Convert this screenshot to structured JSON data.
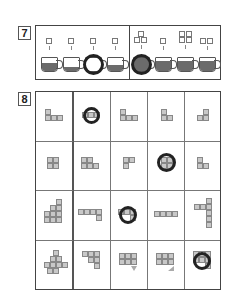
{
  "question7": {
    "number": "7",
    "left_group": [
      {
        "sugar_cubes": 1,
        "fill": 0.6,
        "circled": false
      },
      {
        "sugar_cubes": 1,
        "fill": 0.3,
        "circled": false
      },
      {
        "sugar_cubes": 1,
        "fill": 0.0,
        "circled": true
      },
      {
        "sugar_cubes": 1,
        "fill": 0.5,
        "circled": false
      }
    ],
    "right_group": [
      {
        "sugar_cubes": 3,
        "fill": 1.0,
        "circled": true
      },
      {
        "sugar_cubes": 1,
        "fill": 0.8,
        "circled": false
      },
      {
        "sugar_cubes": 4,
        "fill": 0.8,
        "circled": false
      },
      {
        "sugar_cubes": 2,
        "fill": 0.8,
        "circled": false
      }
    ]
  },
  "question8": {
    "number": "8",
    "rows": [
      {
        "figure": "l-shape-3d",
        "options": [
          "circled-bar",
          "l-3",
          "l-small",
          "j-small"
        ],
        "answer_index": 0
      },
      {
        "figure": "cube-stack-3d",
        "options": [
          "block-2x2-plus",
          "p-shape",
          "circled-square",
          "l-small"
        ],
        "answer_index": 2
      },
      {
        "figure": "stair-3d",
        "options": [
          "bar-with-drop",
          "circled-bar",
          "bar-4",
          "t-shape"
        ],
        "answer_index": 1
      },
      {
        "figure": "pyramid-3d",
        "options": [
          "staircase",
          "grid-with-triangle",
          "grid-with-corner",
          "circled-grid"
        ],
        "answer_index": 3
      }
    ]
  }
}
